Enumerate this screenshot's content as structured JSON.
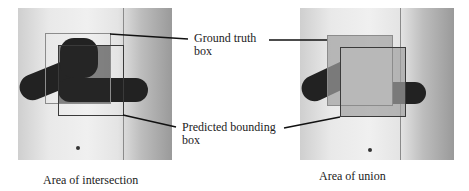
{
  "figure": {
    "labels": {
      "ground_truth": [
        "Ground truth",
        "box"
      ],
      "predicted": [
        "Predicted bounding",
        "box"
      ]
    },
    "captions": {
      "left": "Area of intersection",
      "right": "Area of union"
    },
    "panels": {
      "left": {
        "ground_truth_box": {
          "x": 45,
          "y": 33,
          "w": 65,
          "h": 70
        },
        "predicted_box": {
          "x": 58,
          "y": 45,
          "w": 65,
          "h": 71
        },
        "highlight": "intersection"
      },
      "right": {
        "ground_truth_box": {
          "x": 327,
          "y": 35,
          "w": 65,
          "h": 71
        },
        "predicted_box": {
          "x": 340,
          "y": 47,
          "w": 65,
          "h": 70
        },
        "highlight": "union"
      }
    },
    "colors": {
      "ground_truth_border": "#8c8c8c",
      "predicted_border": "#3a3a3a",
      "intersection_fill": "#3c3c3c",
      "union_fill": "#b4b4b4"
    }
  }
}
